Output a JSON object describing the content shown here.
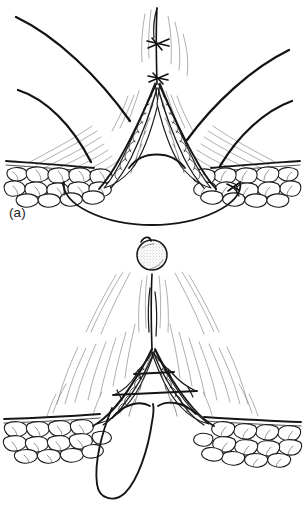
{
  "figure": {
    "type": "surgical-line-illustration",
    "background_color": "#ffffff",
    "ink_color": "#131313",
    "panel_count": 2
  },
  "panels": [
    {
      "id": "a",
      "caption": "(a)",
      "description": "Deep layer closure with retractors holding the wound open; interrupted sutures placed at the apex and a long suture loop passed beneath the subcutaneous fat layer.",
      "elements": {
        "retractors": "four-curved-retractor-blades",
        "knots_visible": 2,
        "knot_labels": [
          "apex-knot-upper",
          "apex-knot-lower"
        ],
        "tissue_layers": [
          "skin-surface",
          "subcutaneous-fat",
          "muscle-fascia-flap"
        ],
        "suture_loop": "deep-arc-loop-beneath-fat",
        "fat_lobule_count_left": 14,
        "fat_lobule_count_right": 14
      }
    },
    {
      "id": "b",
      "caption": "(b)",
      "description": "Pledget swab held above the closed wound; horizontal mattress sutures bridge the triangular apex defect and a long free suture loop hangs below the wound.",
      "elements": {
        "swab": "stippled-gauze-pledget-ball",
        "swab_position": "above-wound-midline",
        "vertical_thread": "midline-suture-thread",
        "crossbars": 2,
        "crossbar_labels": [
          "upper-short-crossbar",
          "lower-long-crossbar"
        ],
        "tissue_layers": [
          "skin-surface",
          "subcutaneous-fat",
          "apex-tissue-flaps"
        ],
        "suture_loop": "pendant-free-loop",
        "fat_lobule_count_left": 13,
        "fat_lobule_count_right": 13
      }
    }
  ],
  "colors": {
    "ink": "#131313",
    "hatch": "#4a4a4a",
    "faint_hatch": "#7d7d7d",
    "paper": "#ffffff",
    "stipple": "#8a8a8a"
  }
}
